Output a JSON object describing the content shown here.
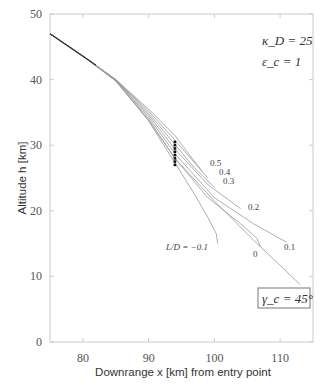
{
  "chart_data": {
    "type": "line",
    "title": "",
    "xlabel": "Downrange x [km] from entry point",
    "ylabel": "Altitude h [km]",
    "xlim": [
      75,
      115
    ],
    "ylim": [
      0,
      50
    ],
    "xticks": [
      80,
      90,
      100,
      110
    ],
    "yticks": [
      0,
      10,
      20,
      30,
      40,
      50
    ],
    "grid": false,
    "annotations": {
      "kappa": "κ_D = 25",
      "epsilon": "ε_c = 1",
      "gamma_box": "γ_c = 45°"
    },
    "series": [
      {
        "name": "L/D = 0.5",
        "label": "0.5",
        "points": [
          [
            75,
            47
          ],
          [
            80,
            43.6
          ],
          [
            85,
            40
          ],
          [
            90,
            35.5
          ],
          [
            94,
            31.5
          ],
          [
            96,
            28.8
          ],
          [
            98,
            26.2
          ]
        ]
      },
      {
        "name": "L/D = 0.4",
        "label": "0.4",
        "points": [
          [
            75,
            47
          ],
          [
            80,
            43.6
          ],
          [
            85,
            40
          ],
          [
            90,
            35.2
          ],
          [
            94,
            30.8
          ],
          [
            97,
            27.3
          ],
          [
            99,
            25
          ]
        ]
      },
      {
        "name": "L/D = 0.3",
        "label": "0.3",
        "points": [
          [
            75,
            47
          ],
          [
            80,
            43.6
          ],
          [
            85,
            40
          ],
          [
            90,
            34.9
          ],
          [
            94,
            30.1
          ],
          [
            97,
            26.5
          ],
          [
            100,
            23.6
          ]
        ]
      },
      {
        "name": "L/D = 0.2",
        "label": "0.2",
        "points": [
          [
            75,
            47
          ],
          [
            80,
            43.6
          ],
          [
            85,
            39.9
          ],
          [
            90,
            34.6
          ],
          [
            94,
            29.4
          ],
          [
            99,
            24
          ],
          [
            104,
            20.3
          ]
        ]
      },
      {
        "name": "L/D = 0.1",
        "label": "0.1",
        "points": [
          [
            75,
            47
          ],
          [
            80,
            43.6
          ],
          [
            85,
            39.9
          ],
          [
            90,
            34.3
          ],
          [
            94,
            28.7
          ],
          [
            100,
            22
          ],
          [
            106,
            18
          ],
          [
            111,
            15.2
          ]
        ]
      },
      {
        "name": "L/D = 0",
        "label": "0",
        "points": [
          [
            75,
            47
          ],
          [
            80,
            43.6
          ],
          [
            85,
            39.8
          ],
          [
            90,
            34
          ],
          [
            94,
            28
          ],
          [
            99,
            22
          ],
          [
            104,
            18
          ],
          [
            106.5,
            15.8
          ],
          [
            107,
            14.5
          ]
        ]
      },
      {
        "name": "L/D = -0.1",
        "label": "L/D = −0.1",
        "points": [
          [
            75,
            47
          ],
          [
            80,
            43.6
          ],
          [
            85,
            39.8
          ],
          [
            90,
            33.7
          ],
          [
            94,
            27.3
          ],
          [
            97,
            22.5
          ],
          [
            99,
            19
          ],
          [
            100.3,
            16.5
          ],
          [
            100.5,
            15
          ]
        ]
      },
      {
        "name": "steep",
        "label": "",
        "points": [
          [
            75,
            47
          ],
          [
            80,
            43.6
          ],
          [
            85,
            39.8
          ],
          [
            90,
            33.8
          ],
          [
            94,
            28
          ],
          [
            100,
            21.5
          ],
          [
            106,
            15.5
          ],
          [
            113,
            8.8
          ]
        ]
      }
    ],
    "markers": {
      "x": 94,
      "y": [
        30.5,
        30,
        29.5,
        29,
        28.5,
        28,
        27.5,
        27
      ]
    }
  }
}
